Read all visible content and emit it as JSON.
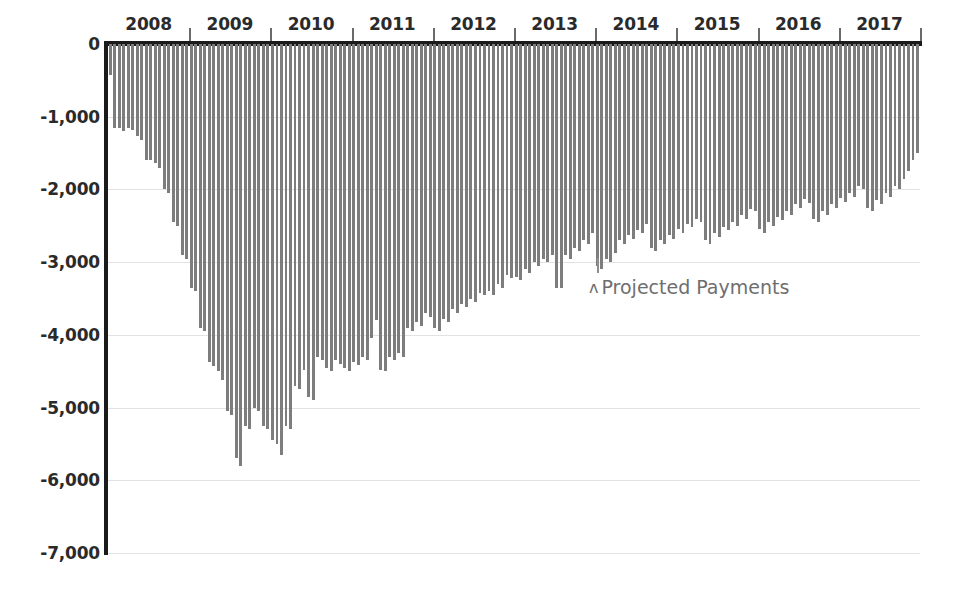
{
  "chart_data": {
    "type": "bar",
    "title": "",
    "subtitle": "",
    "xlabel": "",
    "ylabel": "",
    "ylim": [
      -7000,
      0
    ],
    "y_ticks": [
      0,
      -1000,
      -2000,
      -3000,
      -4000,
      -5000,
      -6000,
      -7000
    ],
    "y_tick_labels": [
      "0",
      "-1,000",
      "-2,000",
      "-3,000",
      "-4,000",
      "-5,000",
      "-6,000",
      "-7,000"
    ],
    "x_tick_labels": [
      "2008",
      "2009",
      "2010",
      "2011",
      "2012",
      "2013",
      "2014",
      "2015",
      "2016",
      "2017"
    ],
    "grid": true,
    "legend": "none",
    "bar_color": "#7d7d7d",
    "axis_color": "#1b1b1b",
    "gridline_color": "#e2e2e2",
    "annotations": [
      {
        "text": "Projected Payments",
        "marker": "ʌ",
        "x_value": 2013.9,
        "y_value": -3300
      }
    ],
    "categories": [
      "2008-01",
      "2008-02",
      "2008-03",
      "2008-04",
      "2008-05",
      "2008-06",
      "2008-07",
      "2008-08",
      "2008-09",
      "2008-10",
      "2008-11",
      "2008-12",
      "2008-13",
      "2008-14",
      "2008-15",
      "2008-16",
      "2008-17",
      "2008-18",
      "2009-01",
      "2009-02",
      "2009-03",
      "2009-04",
      "2009-05",
      "2009-06",
      "2009-07",
      "2009-08",
      "2009-09",
      "2009-10",
      "2009-11",
      "2009-12",
      "2009-13",
      "2009-14",
      "2009-15",
      "2009-16",
      "2009-17",
      "2009-18",
      "2010-01",
      "2010-02",
      "2010-03",
      "2010-04",
      "2010-05",
      "2010-06",
      "2010-07",
      "2010-08",
      "2010-09",
      "2010-10",
      "2010-11",
      "2010-12",
      "2010-13",
      "2010-14",
      "2010-15",
      "2010-16",
      "2010-17",
      "2010-18",
      "2011-01",
      "2011-02",
      "2011-03",
      "2011-04",
      "2011-05",
      "2011-06",
      "2011-07",
      "2011-08",
      "2011-09",
      "2011-10",
      "2011-11",
      "2011-12",
      "2011-13",
      "2011-14",
      "2011-15",
      "2011-16",
      "2011-17",
      "2011-18",
      "2012-01",
      "2012-02",
      "2012-03",
      "2012-04",
      "2012-05",
      "2012-06",
      "2012-07",
      "2012-08",
      "2012-09",
      "2012-10",
      "2012-11",
      "2012-12",
      "2012-13",
      "2012-14",
      "2012-15",
      "2012-16",
      "2012-17",
      "2012-18",
      "2013-01",
      "2013-02",
      "2013-03",
      "2013-04",
      "2013-05",
      "2013-06",
      "2013-07",
      "2013-08",
      "2013-09",
      "2013-10",
      "2013-11",
      "2013-12",
      "2013-13",
      "2013-14",
      "2013-15",
      "2013-16",
      "2013-17",
      "2013-18",
      "2014-01",
      "2014-02",
      "2014-03",
      "2014-04",
      "2014-05",
      "2014-06",
      "2014-07",
      "2014-08",
      "2014-09",
      "2014-10",
      "2014-11",
      "2014-12",
      "2014-13",
      "2014-14",
      "2014-15",
      "2014-16",
      "2014-17",
      "2014-18",
      "2015-01",
      "2015-02",
      "2015-03",
      "2015-04",
      "2015-05",
      "2015-06",
      "2015-07",
      "2015-08",
      "2015-09",
      "2015-10",
      "2015-11",
      "2015-12",
      "2015-13",
      "2015-14",
      "2015-15",
      "2015-16",
      "2015-17",
      "2015-18",
      "2016-01",
      "2016-02",
      "2016-03",
      "2016-04",
      "2016-05",
      "2016-06",
      "2016-07",
      "2016-08",
      "2016-09",
      "2016-10",
      "2016-11",
      "2016-12",
      "2016-13",
      "2016-14",
      "2016-15",
      "2016-16",
      "2016-17",
      "2016-18",
      "2017-01",
      "2017-02",
      "2017-03",
      "2017-04",
      "2017-05",
      "2017-06",
      "2017-07",
      "2017-08",
      "2017-09",
      "2017-10",
      "2017-11",
      "2017-12",
      "2017-13",
      "2017-14",
      "2017-15",
      "2017-16",
      "2017-17",
      "2017-18"
    ],
    "values": [
      -430,
      -1150,
      -1150,
      -1200,
      -1150,
      -1180,
      -1270,
      -1320,
      -1600,
      -1600,
      -1640,
      -1700,
      -2000,
      -2050,
      -2450,
      -2500,
      -2900,
      -2950,
      -3350,
      -3400,
      -3900,
      -3950,
      -4380,
      -4430,
      -4500,
      -4620,
      -5050,
      -5100,
      -5700,
      -5800,
      -5250,
      -5300,
      -5000,
      -5050,
      -5250,
      -5300,
      -5450,
      -5500,
      -5650,
      -5250,
      -5300,
      -4700,
      -4750,
      -4480,
      -4850,
      -4900,
      -4300,
      -4350,
      -4450,
      -4500,
      -4350,
      -4400,
      -4450,
      -4500,
      -4380,
      -4420,
      -4300,
      -4350,
      -4050,
      -3800,
      -4480,
      -4500,
      -4300,
      -4350,
      -4250,
      -4300,
      -3900,
      -3950,
      -3830,
      -3880,
      -3700,
      -3750,
      -3900,
      -3950,
      -3780,
      -3820,
      -3650,
      -3700,
      -3580,
      -3620,
      -3500,
      -3550,
      -3420,
      -3450,
      -3400,
      -3450,
      -3300,
      -3350,
      -3180,
      -3220,
      -3200,
      -3250,
      -3100,
      -3150,
      -3000,
      -3050,
      -2950,
      -3000,
      -2900,
      -3350,
      -3350,
      -2900,
      -2950,
      -2800,
      -2850,
      -2700,
      -2750,
      -2600,
      -3050,
      -3100,
      -2950,
      -3000,
      -2880,
      -2700,
      -2750,
      -2630,
      -2680,
      -2560,
      -2600,
      -2480,
      -2800,
      -2850,
      -2700,
      -2750,
      -2620,
      -2680,
      -2550,
      -2600,
      -2480,
      -2520,
      -2400,
      -2450,
      -2700,
      -2750,
      -2600,
      -2650,
      -2520,
      -2560,
      -2450,
      -2500,
      -2350,
      -2400,
      -2270,
      -2300,
      -2550,
      -2600,
      -2450,
      -2500,
      -2380,
      -2420,
      -2300,
      -2350,
      -2200,
      -2250,
      -2130,
      -2180,
      -2400,
      -2450,
      -2300,
      -2350,
      -2200,
      -2250,
      -2120,
      -2170,
      -2050,
      -2100,
      -1950,
      -2000,
      -2250,
      -2300,
      -2150,
      -2200,
      -2050,
      -2100,
      -1950,
      -2000,
      -1850,
      -1750,
      -1600,
      -1500
    ]
  }
}
